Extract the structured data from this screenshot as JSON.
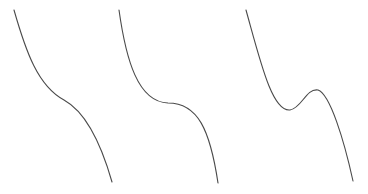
{
  "diagram": {
    "stroke_color": "#4a4a4a",
    "background": "#ffffff",
    "curves": [
      {
        "id": "cubic-no-stationary-point",
        "path": "M14,10 C26,52 38,86 64,100 C84,111 100,140 112,182"
      },
      {
        "id": "cubic-stationary-inflection",
        "path": "M119,10 C126,60 138,102 168,103 C198,103 210,130 218,183"
      },
      {
        "id": "cubic-local-min-max",
        "path": "M246,10 C260,60 272,112 290,110 C302,108 306,88 318,90 C330,94 344,140 353,181"
      }
    ]
  }
}
